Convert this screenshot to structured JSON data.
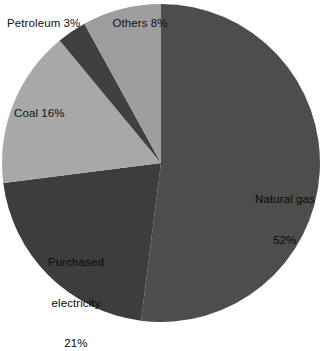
{
  "chart_data": {
    "type": "pie",
    "title": "",
    "subtitle": "",
    "xlabel": "",
    "ylabel": "",
    "legend_position": "none",
    "grid": false,
    "start_angle_deg": 0,
    "direction": "clockwise",
    "categories": [
      "Natural gas",
      "Purchased electricity",
      "Coal",
      "Petroleum",
      "Others"
    ],
    "values": [
      52,
      21,
      16,
      3,
      8
    ],
    "value_unit": "%",
    "slices": [
      {
        "name": "Natural gas",
        "value": 52,
        "label_name": "Natural gas",
        "label_value": "52%",
        "color": "#4d4d4d",
        "label_placement": "inside"
      },
      {
        "name": "Purchased electricity",
        "value": 21,
        "label_line1": "Purchased",
        "label_line2": "electricity",
        "label_value": "21%",
        "color": "#3d3d3d",
        "label_placement": "inside"
      },
      {
        "name": "Coal",
        "value": 16,
        "label_text": "Coal 16%",
        "color": "#a8a8a8",
        "label_placement": "inside"
      },
      {
        "name": "Petroleum",
        "value": 3,
        "label_text": "Petroleum 3%",
        "color": "#404040",
        "label_placement": "outside"
      },
      {
        "name": "Others",
        "value": 8,
        "label_text": "Others 8%",
        "color": "#9e9e9e",
        "label_placement": "inside"
      }
    ],
    "background_color": "#ffffff",
    "label_text_color": "#111111"
  },
  "labels": {
    "natural_gas_name": "Natural gas",
    "natural_gas_value": "52%",
    "purchased_electricity_line1": "Purchased",
    "purchased_electricity_line2": "electricity",
    "purchased_electricity_value": "21%",
    "coal": "Coal 16%",
    "petroleum": "Petroleum 3%",
    "others": "Others 8%"
  }
}
